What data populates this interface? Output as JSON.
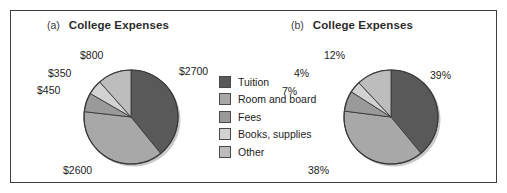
{
  "figure": {
    "legend": {
      "items": [
        {
          "label": "Tuition",
          "color": "#595959"
        },
        {
          "label": "Room and board",
          "color": "#a8a8a8"
        },
        {
          "label": "Fees",
          "color": "#9a9a9a"
        },
        {
          "label": "Books, supplies",
          "color": "#d2d2d2"
        },
        {
          "label": "Other",
          "color": "#bdbdbd"
        }
      ]
    }
  },
  "chart_data": [
    {
      "type": "pie",
      "panel": "(a)",
      "title": "College Expenses",
      "categories": [
        "Tuition",
        "Room and board",
        "Fees",
        "Books, supplies",
        "Other"
      ],
      "values": [
        2700,
        2600,
        450,
        350,
        800
      ],
      "labels": [
        "$2700",
        "$2600",
        "$450",
        "$350",
        "$800"
      ],
      "colors": [
        "#595959",
        "#a8a8a8",
        "#9a9a9a",
        "#d2d2d2",
        "#bdbdbd"
      ],
      "start_angle": 0,
      "direction": "clockwise",
      "total": 6900,
      "units": "US dollars"
    },
    {
      "type": "pie",
      "panel": "(b)",
      "title": "College Expenses",
      "categories": [
        "Tuition",
        "Room and board",
        "Fees",
        "Books, supplies",
        "Other"
      ],
      "values": [
        39,
        38,
        7,
        4,
        12
      ],
      "labels": [
        "39%",
        "38%",
        "7%",
        "4%",
        "12%"
      ],
      "colors": [
        "#595959",
        "#a8a8a8",
        "#9a9a9a",
        "#d2d2d2",
        "#bdbdbd"
      ],
      "start_angle": 0,
      "direction": "clockwise",
      "total": 100,
      "units": "percent"
    }
  ]
}
